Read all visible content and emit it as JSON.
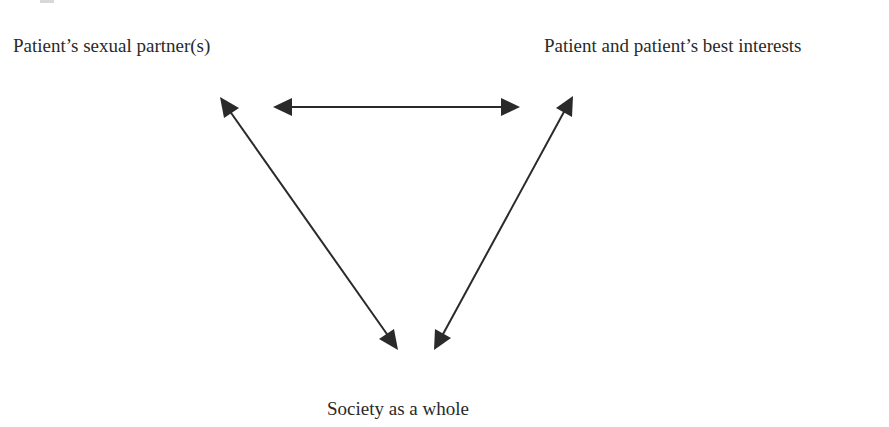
{
  "diagram": {
    "nodes": [
      {
        "id": "partner",
        "label": "Patient’s sexual partner(s)"
      },
      {
        "id": "patient",
        "label": "Patient and patient’s best interests"
      },
      {
        "id": "society",
        "label": "Society as a whole"
      }
    ],
    "edges": [
      {
        "from": "partner",
        "to": "patient",
        "type": "bidirectional-arrow"
      },
      {
        "from": "partner",
        "to": "society",
        "type": "bidirectional-arrow"
      },
      {
        "from": "patient",
        "to": "society",
        "type": "bidirectional-arrow"
      }
    ],
    "colors": {
      "line": "#2a2a2a",
      "text": "#2a2a2a",
      "background": "#ffffff"
    }
  }
}
